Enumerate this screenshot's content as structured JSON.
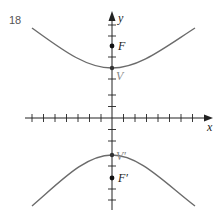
{
  "figure": {
    "number": "18",
    "axes": {
      "x_label": "x",
      "y_label": "y"
    },
    "points": [
      {
        "id": "F",
        "label": "F",
        "px": [
          112,
          46
        ],
        "kind": "focus"
      },
      {
        "id": "V",
        "label": "V",
        "px": [
          112,
          68
        ],
        "kind": "vertex"
      },
      {
        "id": "Vp",
        "label": "V′",
        "px": [
          112,
          155
        ],
        "kind": "vertex"
      },
      {
        "id": "Fp",
        "label": "F′",
        "px": [
          112,
          178
        ],
        "kind": "focus"
      }
    ],
    "curves": [
      {
        "name": "upper-branch",
        "description": "upper branch of hyperbola opening upward with vertex V"
      },
      {
        "name": "lower-branch",
        "description": "lower branch of hyperbola opening downward with vertex V'"
      }
    ],
    "colors": {
      "curve": "#6b6b6b",
      "axis": "#222222",
      "vertex_label": "#888888",
      "focus_label": "#222222"
    }
  }
}
